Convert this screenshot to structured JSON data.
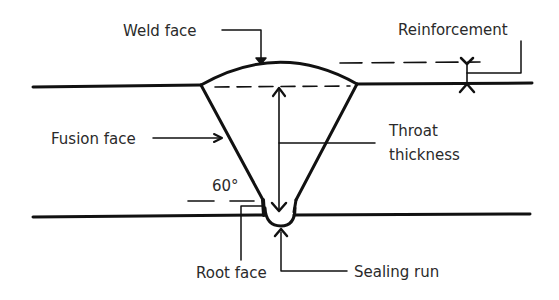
{
  "diagram": {
    "colors": {
      "line": "#111111",
      "text": "#2a2a2a",
      "background": "#ffffff"
    },
    "labels": {
      "weld_face": "Weld face",
      "reinforcement": "Reinforcement",
      "fusion_face": "Fusion face",
      "throat_thickness_line1": "Throat",
      "throat_thickness_line2": "thickness",
      "angle": "60°",
      "root_face": "Root face",
      "sealing_run": "Sealing run"
    }
  }
}
